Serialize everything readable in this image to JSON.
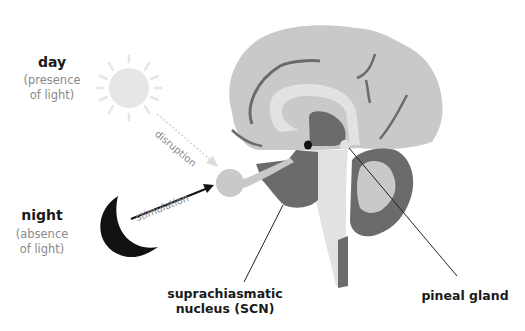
{
  "labels": {
    "day": {
      "title": "day",
      "subtitle_line1": "(presence",
      "subtitle_line2": "of light)"
    },
    "night": {
      "title": "night",
      "subtitle_line1": "(absence",
      "subtitle_line2": "of light)"
    },
    "scn": {
      "line1": "suprachiasmatic",
      "line2": "nucleus (SCN)"
    },
    "pineal": {
      "text": "pineal gland"
    },
    "arrows": {
      "disruption": "disruption",
      "stimulation": "stimulation"
    }
  },
  "colors": {
    "brain_light": "#c9c9c9",
    "brain_lighter": "#e2e2e2",
    "brain_dark": "#6b6b6b",
    "sun": "#e6e6e6",
    "moon": "#111111",
    "text_dark": "#1a1a1a",
    "text_muted": "#8a8a8a"
  }
}
